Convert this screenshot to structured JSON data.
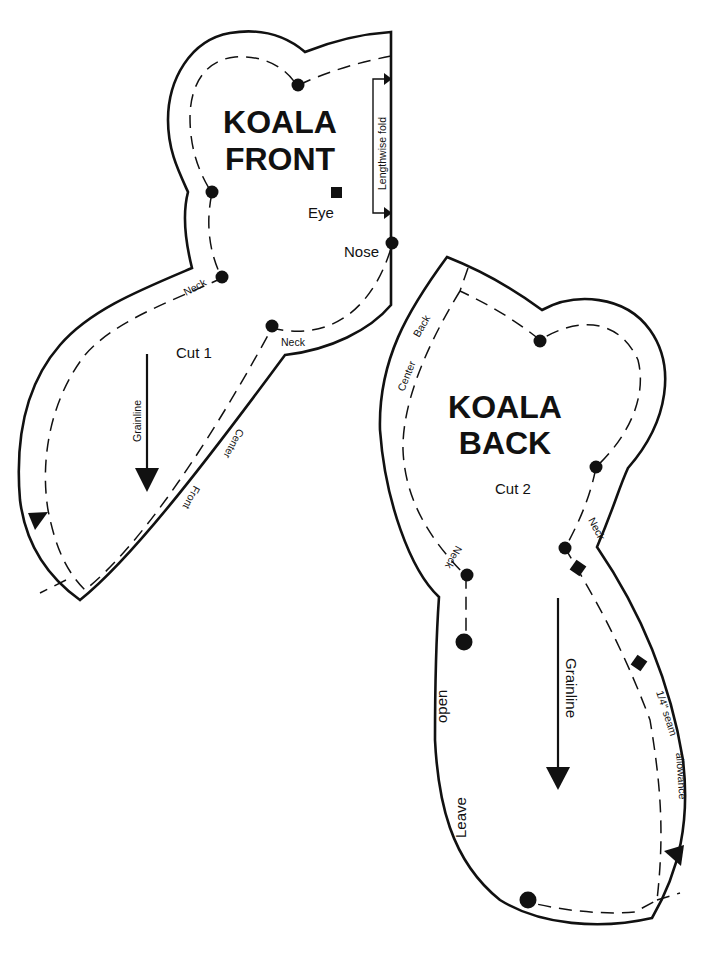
{
  "front_piece": {
    "title_line1": "KOALA",
    "title_line2": "FRONT",
    "cut_label": "Cut 1",
    "grainline_label": "Grainline",
    "fold_label": "Lengthwise fold",
    "eye_label": "Eye",
    "nose_label": "Nose",
    "neck_label_left": "Neck",
    "neck_label_right": "Neck",
    "center_label": "Center",
    "front_label": "Front"
  },
  "back_piece": {
    "title_line1": "KOALA",
    "title_line2": "BACK",
    "cut_label": "Cut 2",
    "grainline_label": "Grainline",
    "center_label": "Center",
    "back_label": "Back",
    "neck_label_left": "Neck",
    "neck_label_right": "Neck",
    "seam_label": "1/4\" seam",
    "allowance_label": "allowance",
    "open_label": "open",
    "leave_label": "Leave"
  },
  "markers": {
    "dot_icon": "circle-match-point",
    "square_icon": "square-match-point",
    "notch_icon": "triangle-notch",
    "arrow_icon": "grainline-arrow"
  },
  "colors": {
    "ink": "#111111",
    "paper": "#ffffff"
  }
}
